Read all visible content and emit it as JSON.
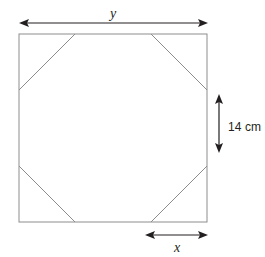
{
  "figure": {
    "stroke_color": "#8d8d8d",
    "arrow_color": "#231f20",
    "background_color": "#ffffff",
    "square": {
      "left": 19,
      "top": 34,
      "right": 207,
      "bottom": 222,
      "side_px": 188
    },
    "octagon_cut_px": 56,
    "labels": {
      "top_width": "y",
      "bottom_segment": "x",
      "side_height": "14 cm"
    },
    "dimension_lines": {
      "top": {
        "x1": 20,
        "x2": 207,
        "y": 23,
        "label": "y",
        "arrows": "both"
      },
      "right": {
        "x": 219,
        "y1": 95,
        "y2": 152,
        "label": "14 cm",
        "arrows": "both"
      },
      "bottom": {
        "x1": 146,
        "x2": 207,
        "y": 235,
        "label": "x",
        "arrows": "both"
      }
    }
  }
}
